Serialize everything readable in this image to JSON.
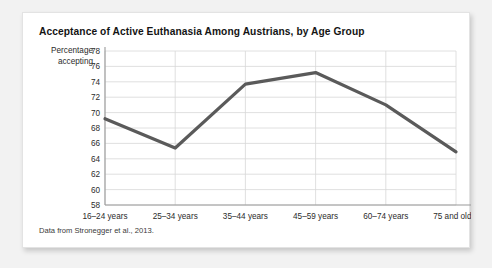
{
  "card": {
    "title": "Acceptance of Active Euthanasia Among Austrians, by Age Group",
    "source_note": "Data from Stronegger et al., 2013."
  },
  "axis": {
    "y_title_line1": "Percentage",
    "y_title_line2": "accepting"
  },
  "colors": {
    "line": "#5a5a5a",
    "grid": "#d8d8d8",
    "axis": "#9a9a9a",
    "text": "#2b2b2b",
    "card_bg": "#ffffff",
    "page_bg": "#f2f2f2"
  },
  "chart_data": {
    "type": "line",
    "title": "Acceptance of Active Euthanasia Among Austrians, by Age Group",
    "xlabel": "",
    "ylabel": "Percentage accepting",
    "categories": [
      "16–24 years",
      "25–34 years",
      "35–44 years",
      "45–59 years",
      "60–74 years",
      "75 and older"
    ],
    "values": [
      69.2,
      65.4,
      73.7,
      75.2,
      71.0,
      64.9
    ],
    "ylim": [
      58,
      78
    ],
    "ytick_step": 2,
    "yticks": [
      78,
      76,
      74,
      72,
      70,
      68,
      66,
      64,
      62,
      60,
      58
    ],
    "grid": true,
    "legend": "none",
    "series": [
      {
        "name": "Percentage accepting",
        "values": [
          69.2,
          65.4,
          73.7,
          75.2,
          71.0,
          64.9
        ]
      }
    ],
    "annotations": [
      "Data from Stronegger et al., 2013."
    ]
  }
}
